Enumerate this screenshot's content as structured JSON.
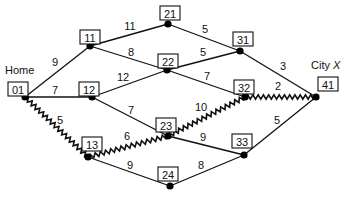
{
  "places": {
    "home": "Home",
    "city": "City ",
    "city_var": "X"
  },
  "nodes": [
    {
      "id": "01",
      "x": 25,
      "y": 97,
      "bx": 8,
      "by": 82
    },
    {
      "id": "11",
      "x": 90,
      "y": 46,
      "bx": 80,
      "by": 30
    },
    {
      "id": "12",
      "x": 92,
      "y": 97,
      "bx": 79,
      "by": 82
    },
    {
      "id": "13",
      "x": 88,
      "y": 157,
      "bx": 82,
      "by": 137
    },
    {
      "id": "21",
      "x": 168,
      "y": 24,
      "bx": 160,
      "by": 6
    },
    {
      "id": "22",
      "x": 167,
      "y": 70,
      "bx": 158,
      "by": 54
    },
    {
      "id": "23",
      "x": 168,
      "y": 136,
      "bx": 156,
      "by": 118
    },
    {
      "id": "24",
      "x": 170,
      "y": 186,
      "bx": 158,
      "by": 167
    },
    {
      "id": "31",
      "x": 240,
      "y": 51,
      "bx": 233,
      "by": 32
    },
    {
      "id": "32",
      "x": 245,
      "y": 97,
      "bx": 234,
      "by": 80
    },
    {
      "id": "33",
      "x": 244,
      "y": 155,
      "bx": 232,
      "by": 134
    },
    {
      "id": "41",
      "x": 316,
      "y": 97,
      "bx": 318,
      "by": 77
    }
  ],
  "edges": [
    {
      "from": "01",
      "to": "11",
      "weight": "9",
      "lx": 55,
      "ly": 62,
      "highlighted": false
    },
    {
      "from": "01",
      "to": "12",
      "weight": "7",
      "lx": 55,
      "ly": 90,
      "highlighted": false
    },
    {
      "from": "01",
      "to": "13",
      "weight": "5",
      "lx": 60,
      "ly": 120,
      "highlighted": true
    },
    {
      "from": "11",
      "to": "21",
      "weight": "11",
      "lx": 130,
      "ly": 26,
      "highlighted": false
    },
    {
      "from": "11",
      "to": "22",
      "weight": "8",
      "lx": 131,
      "ly": 52,
      "highlighted": false
    },
    {
      "from": "12",
      "to": "22",
      "weight": "12",
      "lx": 123,
      "ly": 77,
      "highlighted": false
    },
    {
      "from": "12",
      "to": "23",
      "weight": "7",
      "lx": 131,
      "ly": 110,
      "highlighted": false
    },
    {
      "from": "13",
      "to": "23",
      "weight": "6",
      "lx": 127,
      "ly": 136,
      "highlighted": true
    },
    {
      "from": "13",
      "to": "24",
      "weight": "9",
      "lx": 130,
      "ly": 165,
      "highlighted": false
    },
    {
      "from": "21",
      "to": "31",
      "weight": "5",
      "lx": 205,
      "ly": 29,
      "highlighted": false
    },
    {
      "from": "22",
      "to": "31",
      "weight": "5",
      "lx": 203,
      "ly": 52,
      "highlighted": false
    },
    {
      "from": "22",
      "to": "32",
      "weight": "7",
      "lx": 207,
      "ly": 76,
      "highlighted": false
    },
    {
      "from": "23",
      "to": "32",
      "weight": "10",
      "lx": 201,
      "ly": 107,
      "highlighted": true
    },
    {
      "from": "23",
      "to": "33",
      "weight": "9",
      "lx": 203,
      "ly": 137,
      "highlighted": false
    },
    {
      "from": "24",
      "to": "33",
      "weight": "8",
      "lx": 201,
      "ly": 165,
      "highlighted": false
    },
    {
      "from": "31",
      "to": "41",
      "weight": "3",
      "lx": 283,
      "ly": 66,
      "highlighted": false
    },
    {
      "from": "32",
      "to": "41",
      "weight": "2",
      "lx": 278,
      "ly": 86,
      "highlighted": true
    },
    {
      "from": "33",
      "to": "41",
      "weight": "5",
      "lx": 277,
      "ly": 120,
      "highlighted": false
    }
  ],
  "shortest_path": [
    "01",
    "13",
    "23",
    "32",
    "41"
  ]
}
